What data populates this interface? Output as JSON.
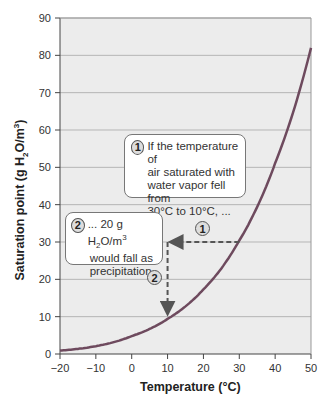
{
  "chart_data": {
    "type": "line",
    "title": "",
    "xlabel": "Temperature (°C)",
    "ylabel": "Saturation point (g H2O/m3)",
    "xlim": [
      -20,
      50
    ],
    "ylim": [
      0,
      90
    ],
    "x_ticks": [
      "−20",
      "−10",
      "0",
      "10",
      "20",
      "30",
      "40",
      "50"
    ],
    "y_ticks": [
      "0",
      "10",
      "20",
      "30",
      "40",
      "50",
      "60",
      "70",
      "80",
      "90"
    ],
    "grid": "horizontal",
    "series": [
      {
        "name": "Saturation curve",
        "x": [
          -20,
          -10,
          0,
          10,
          20,
          30,
          40,
          50
        ],
        "values": [
          0.9,
          2.1,
          4.8,
          9.4,
          17.3,
          30.4,
          51.1,
          82
        ]
      }
    ],
    "annotations": [
      {
        "id": "1",
        "text": "If the temperature of air saturated with water vapor fell from 30°C to 10°C, ...",
        "arrow": {
          "from": [
            30,
            30
          ],
          "to": [
            10,
            30
          ]
        }
      },
      {
        "id": "2",
        "text": "... 20 g H2O/m3 would fall as precipitation.",
        "arrow": {
          "from": [
            10,
            30
          ],
          "to": [
            10,
            10
          ]
        }
      }
    ]
  },
  "labels": {
    "xlabel": "Temperature (°C)",
    "ylabel_main": "Saturation point (g H",
    "ylabel_sub": "2",
    "ylabel_mid": "O/m",
    "ylabel_sup": "3",
    "ylabel_end": ")",
    "box1_num": "1",
    "box1_lines": [
      "If the temperature of",
      "air saturated with",
      "water vapor fell from",
      "30°C to 10°C, ..."
    ],
    "box2_num": "2",
    "box2_line1_pre": "... 20 g H",
    "box2_line1_sub": "2",
    "box2_line1_mid": "O/m",
    "box2_line1_sup": "3",
    "box2_line2": "would fall as",
    "box2_line3": "precipitation.",
    "marker1": "1",
    "marker2": "2"
  },
  "colors": {
    "plot_bg": "#ececec",
    "curve": "#6e4a5e",
    "grid": "#b5b5b5",
    "arrow": "#555555"
  }
}
